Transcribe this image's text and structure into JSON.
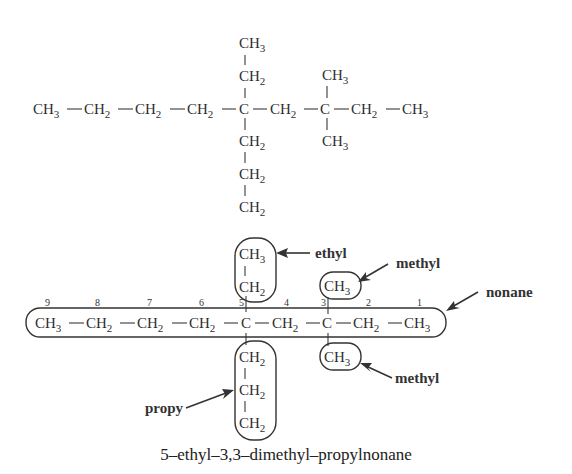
{
  "top_structure": {
    "main_chain": [
      "CH3",
      "CH2",
      "CH2",
      "CH2",
      "C",
      "CH2",
      "C",
      "CH2",
      "CH3"
    ],
    "c5_up": [
      "CH2",
      "CH3"
    ],
    "c5_down": [
      "CH2",
      "CH2",
      "CH2"
    ],
    "c3_up": [
      "CH3"
    ],
    "c3_down": [
      "CH3"
    ]
  },
  "bottom_structure": {
    "main_chain": [
      "CH3",
      "CH2",
      "CH2",
      "CH2",
      "C",
      "CH2",
      "C",
      "CH2",
      "CH3"
    ],
    "locants": [
      "9",
      "8",
      "7",
      "6",
      "5",
      "4",
      "3",
      "2",
      "1"
    ],
    "c5_up": [
      "CH2",
      "CH3"
    ],
    "c5_down": [
      "CH2",
      "CH2",
      "CH2"
    ],
    "c3_up": [
      "CH3"
    ],
    "c3_down": [
      "CH3"
    ],
    "labels": {
      "ethyl": "ethyl",
      "methyl_top": "methyl",
      "nonane": "nonane",
      "methyl_bottom": "methyl",
      "propyl": "propy"
    }
  },
  "name": "5–ethyl–3,3–dimethyl–propylnonane",
  "colors": {
    "ink": "#2e2e2e",
    "background": "#ffffff"
  }
}
